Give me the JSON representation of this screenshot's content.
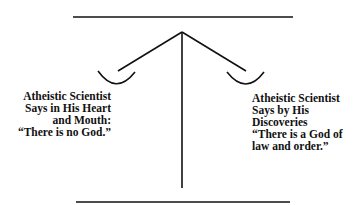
{
  "diagram": {
    "type": "balance-scale",
    "stroke_color": "#111111",
    "background": "#ffffff",
    "left_pan": {
      "lines": [
        "Atheistic Scientist",
        "Says in His Heart",
        "and Mouth:",
        "“There is no God.”"
      ]
    },
    "right_pan": {
      "lines": [
        "Atheistic Scientist",
        "Says by His",
        "Discoveries",
        "“There is a God of",
        "law and order.”"
      ]
    }
  }
}
